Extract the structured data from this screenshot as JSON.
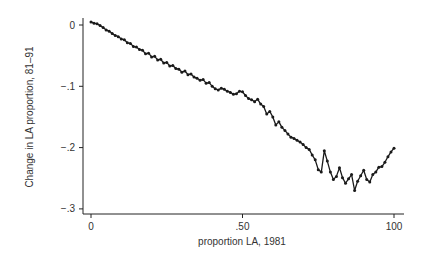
{
  "chart_data": {
    "type": "line",
    "subtype": "connected-scatter",
    "title": "",
    "xlabel": "proportion LA, 1981",
    "ylabel": "Change in LA proportion, 81–91",
    "x_tick_labels_as_shown": [
      "0",
      ".50",
      "100"
    ],
    "x_tick_positions": [
      0,
      50,
      100
    ],
    "x_scale_note": "Tick labels are mutually inconsistent: '0' and '100' suggest a 0-100 scale while '.50' suggests a 0-1 proportion scale. x values below use an ASSUMED 0-100 index aligned to the tick positions; the true units are not determinable from the image.",
    "x_scale_assumed": true,
    "xlim": [
      0,
      100
    ],
    "y_ticks": [
      0,
      -0.1,
      -0.2,
      -0.3
    ],
    "y_tick_labels": [
      "0",
      "−.1",
      "−.2",
      "−.3"
    ],
    "ylim": [
      -0.3,
      0.0
    ],
    "grid": false,
    "legend": null,
    "values_note": "y values estimated from pixel positions of plotted markers; approximate.",
    "series": [
      {
        "name": "Change in LA proportion",
        "marker": "circle",
        "color": "#1a1a1a",
        "points": [
          [
            0,
            0.005
          ],
          [
            1,
            0.003
          ],
          [
            2,
            0.002
          ],
          [
            3,
            -0.001
          ],
          [
            4,
            -0.004
          ],
          [
            5,
            -0.008
          ],
          [
            6,
            -0.01
          ],
          [
            7,
            -0.014
          ],
          [
            8,
            -0.017
          ],
          [
            9,
            -0.019
          ],
          [
            10,
            -0.023
          ],
          [
            11,
            -0.024
          ],
          [
            12,
            -0.029
          ],
          [
            13,
            -0.03
          ],
          [
            14,
            -0.035
          ],
          [
            15,
            -0.036
          ],
          [
            16,
            -0.04
          ],
          [
            17,
            -0.041
          ],
          [
            18,
            -0.047
          ],
          [
            19,
            -0.046
          ],
          [
            20,
            -0.052
          ],
          [
            21,
            -0.051
          ],
          [
            22,
            -0.057
          ],
          [
            23,
            -0.056
          ],
          [
            24,
            -0.062
          ],
          [
            25,
            -0.061
          ],
          [
            26,
            -0.067
          ],
          [
            27,
            -0.066
          ],
          [
            28,
            -0.071
          ],
          [
            29,
            -0.072
          ],
          [
            30,
            -0.077
          ],
          [
            31,
            -0.075
          ],
          [
            32,
            -0.081
          ],
          [
            33,
            -0.08
          ],
          [
            34,
            -0.085
          ],
          [
            35,
            -0.087
          ],
          [
            36,
            -0.09
          ],
          [
            37,
            -0.089
          ],
          [
            38,
            -0.095
          ],
          [
            39,
            -0.094
          ],
          [
            40,
            -0.1
          ],
          [
            41,
            -0.104
          ],
          [
            42,
            -0.106
          ],
          [
            43,
            -0.103
          ],
          [
            44,
            -0.105
          ],
          [
            45,
            -0.108
          ],
          [
            46,
            -0.11
          ],
          [
            47,
            -0.113
          ],
          [
            48,
            -0.112
          ],
          [
            49,
            -0.108
          ],
          [
            50,
            -0.109
          ],
          [
            51,
            -0.115
          ],
          [
            52,
            -0.12
          ],
          [
            53,
            -0.122
          ],
          [
            54,
            -0.125
          ],
          [
            55,
            -0.121
          ],
          [
            56,
            -0.129
          ],
          [
            57,
            -0.133
          ],
          [
            58,
            -0.145
          ],
          [
            59,
            -0.141
          ],
          [
            60,
            -0.15
          ],
          [
            61,
            -0.163
          ],
          [
            62,
            -0.158
          ],
          [
            63,
            -0.167
          ],
          [
            64,
            -0.172
          ],
          [
            65,
            -0.178
          ],
          [
            66,
            -0.183
          ],
          [
            67,
            -0.185
          ],
          [
            68,
            -0.188
          ],
          [
            69,
            -0.191
          ],
          [
            70,
            -0.195
          ],
          [
            71,
            -0.2
          ],
          [
            72,
            -0.203
          ],
          [
            73,
            -0.212
          ],
          [
            74,
            -0.22
          ],
          [
            75,
            -0.236
          ],
          [
            76,
            -0.24
          ],
          [
            77,
            -0.205
          ],
          [
            78,
            -0.222
          ],
          [
            79,
            -0.24
          ],
          [
            80,
            -0.252
          ],
          [
            81,
            -0.247
          ],
          [
            82,
            -0.233
          ],
          [
            83,
            -0.249
          ],
          [
            84,
            -0.258
          ],
          [
            85,
            -0.251
          ],
          [
            86,
            -0.244
          ],
          [
            87,
            -0.27
          ],
          [
            88,
            -0.255
          ],
          [
            89,
            -0.246
          ],
          [
            90,
            -0.237
          ],
          [
            91,
            -0.252
          ],
          [
            92,
            -0.256
          ],
          [
            93,
            -0.244
          ],
          [
            94,
            -0.24
          ],
          [
            95,
            -0.232
          ],
          [
            96,
            -0.231
          ],
          [
            97,
            -0.224
          ],
          [
            98,
            -0.215
          ],
          [
            99,
            -0.207
          ],
          [
            100,
            -0.201
          ]
        ]
      }
    ]
  },
  "axes": {
    "x": {
      "title": "proportion LA, 1981",
      "tick_labels": [
        "0",
        ".50",
        "100"
      ]
    },
    "y": {
      "title": "Change in LA proportion, 81–91",
      "tick_labels": [
        "0",
        "−.1",
        "−.2",
        "−.3"
      ]
    }
  }
}
